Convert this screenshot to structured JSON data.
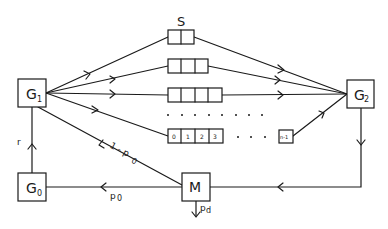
{
  "diagram": {
    "type": "queueing-network",
    "colors": {
      "stroke": "#1a1a1a",
      "background": "#ffffff"
    },
    "nodes": {
      "g1": {
        "label": "G",
        "sub": "1"
      },
      "g2": {
        "label": "G",
        "sub": "2"
      },
      "g0": {
        "label": "G",
        "sub": "0"
      },
      "m": {
        "label": "M"
      }
    },
    "queues": {
      "label": "S",
      "rows": [
        {
          "cells": 2
        },
        {
          "cells": 3
        },
        {
          "cells": 4
        },
        {
          "cells": 4,
          "cell_labels": [
            "0",
            "1",
            "2",
            "3"
          ],
          "last_label": "n-1"
        }
      ],
      "ellipsis": "· · · · · ·"
    },
    "edges": {
      "g0_to_g1": "r",
      "m_to_g1": "1 - p",
      "m_to_g1_sub": "0",
      "m_to_g0": "p",
      "m_to_g0_sub": "0",
      "m_out": "p",
      "m_out_sub": "d"
    }
  }
}
